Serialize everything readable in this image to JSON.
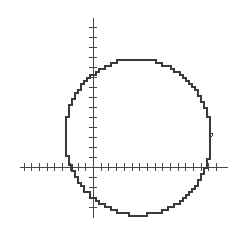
{
  "figure": {
    "background": "#ffffff",
    "axis_color": "#4a4a4a",
    "curve_color": "#3a3a3a"
  },
  "axes": {
    "origin_px": [
      93,
      167
    ],
    "x_axis": {
      "from_px": 20,
      "to_px": 228,
      "tick_spacing_px": 7.7,
      "tick_len_px": 4
    },
    "y_axis": {
      "from_px": 18,
      "to_px": 218,
      "tick_spacing_px": 10,
      "tick_len_px": 4
    },
    "tick_labels": []
  },
  "curve": {
    "type": "circle",
    "center_px": [
      138,
      137
    ],
    "radius_x_px": 73,
    "radius_y_px": 78,
    "step_px": 3,
    "notch": {
      "at_px": [
        211,
        133
      ]
    }
  }
}
